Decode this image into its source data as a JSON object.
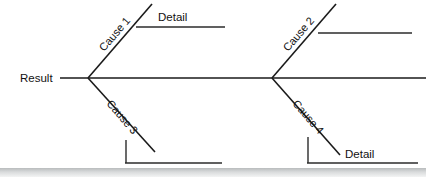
{
  "diagram": {
    "type": "fishbone-ishikawa",
    "effect": {
      "label": "Result",
      "x": 20,
      "y": 78
    },
    "spine": {
      "x1": 60,
      "y1": 78,
      "x2": 426,
      "y2": 78,
      "color": "#1a1a1a"
    },
    "junctions": [
      {
        "name": "left-junction",
        "x": 88,
        "y": 78
      },
      {
        "name": "right-junction",
        "x": 272,
        "y": 78
      }
    ],
    "branches": [
      {
        "id": "cause-1",
        "label": "Cause 1",
        "position": "upper-left",
        "line": {
          "x1": 88,
          "y1": 78,
          "x2": 152,
          "y2": 4
        },
        "label_x": 104,
        "label_y": 52,
        "label_rotation": -49,
        "sub": {
          "id": "detail-1",
          "label": "Detail",
          "line": {
            "x1": 136,
            "y1": 27,
            "x2": 225,
            "y2": 27
          },
          "label_x": 158,
          "label_y": 17
        }
      },
      {
        "id": "cause-2",
        "label": "Cause 2",
        "position": "upper-right",
        "line": {
          "x1": 272,
          "y1": 78,
          "x2": 336,
          "y2": 4
        },
        "label_x": 288,
        "label_y": 52,
        "label_rotation": -49,
        "sub": {
          "id": "detail-2",
          "label": "",
          "line": {
            "x1": 318,
            "y1": 33,
            "x2": 412,
            "y2": 33
          },
          "label_x": 0,
          "label_y": 0
        }
      },
      {
        "id": "cause-3",
        "label": "Cause 3",
        "position": "lower-left",
        "line": {
          "x1": 88,
          "y1": 78,
          "x2": 155,
          "y2": 152
        },
        "label_x": 106,
        "label_y": 104,
        "label_rotation": 49,
        "sub": {
          "id": "detail-3",
          "label": "",
          "vertical": {
            "x1": 126,
            "y1": 140,
            "x2": 126,
            "y2": 163
          },
          "horizontal": {
            "x1": 126,
            "y1": 163,
            "x2": 222,
            "y2": 163
          },
          "label_x": 0,
          "label_y": 0
        }
      },
      {
        "id": "cause-4",
        "label": "Cause 4",
        "position": "lower-right",
        "line": {
          "x1": 272,
          "y1": 78,
          "x2": 340,
          "y2": 155
        },
        "label_x": 292,
        "label_y": 104,
        "label_rotation": 49,
        "sub": {
          "id": "detail-4",
          "label": "Detail",
          "vertical": {
            "x1": 308,
            "y1": 137,
            "x2": 308,
            "y2": 163
          },
          "horizontal": {
            "x1": 308,
            "y1": 163,
            "x2": 418,
            "y2": 163
          },
          "label_x": 345,
          "label_y": 154
        }
      }
    ],
    "footer_band": {
      "top": 168,
      "height": 9,
      "color": "#c6c9ca"
    }
  }
}
